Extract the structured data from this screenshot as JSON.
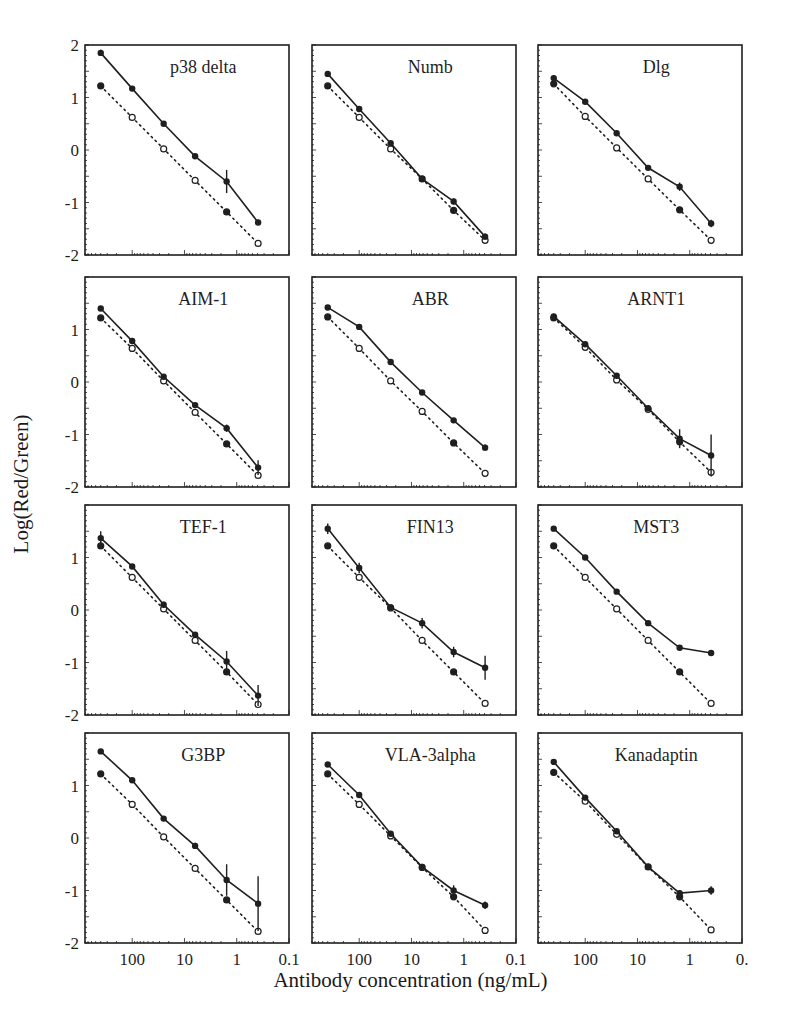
{
  "chart_data": {
    "type": "line",
    "layout": "4x3 grid of small multiples",
    "xlabel": "Antibody concentration (ng/mL)",
    "ylabel": "Log(Red/Green)",
    "xscale": "log",
    "xlim": [
      800,
      0.1
    ],
    "ylim": [
      -2,
      2
    ],
    "x_tick_labels": [
      "100",
      "10",
      "1",
      "0.1"
    ],
    "x_tick_labels_last_panel": [
      "100",
      "10",
      "1",
      "0."
    ],
    "y_tick_labels": [
      "2",
      "1",
      "0",
      "-1",
      "-2"
    ],
    "x": [
      400,
      100,
      25,
      6.25,
      1.56,
      0.39
    ],
    "series_styles": {
      "measured": "solid line, filled circles, error bars",
      "reference": "dotted line, open/filled markers"
    },
    "panels": [
      {
        "title": "p38 delta",
        "measured": [
          1.85,
          1.17,
          0.5,
          -0.12,
          -0.6,
          -1.38
        ],
        "errors": [
          0.06,
          0.04,
          0.03,
          0.04,
          0.22,
          0.05
        ],
        "reference": [
          1.22,
          0.62,
          0.02,
          -0.58,
          -1.18,
          -1.78
        ]
      },
      {
        "title": "Numb",
        "measured": [
          1.45,
          0.78,
          0.13,
          -0.55,
          -0.98,
          -1.65
        ],
        "errors": [
          0.05,
          0.03,
          0.04,
          0.03,
          0.06,
          0.06
        ],
        "reference": [
          1.22,
          0.62,
          0.02,
          -0.55,
          -1.15,
          -1.72
        ]
      },
      {
        "title": "Dlg",
        "measured": [
          1.37,
          0.92,
          0.32,
          -0.34,
          -0.7,
          -1.4
        ],
        "errors": [
          0.05,
          0.03,
          0.03,
          0.03,
          0.08,
          0.07
        ],
        "reference": [
          1.26,
          0.64,
          0.04,
          -0.55,
          -1.14,
          -1.72
        ]
      },
      {
        "title": "AIM-1",
        "measured": [
          1.4,
          0.78,
          0.1,
          -0.44,
          -0.88,
          -1.63
        ],
        "errors": [
          0.03,
          0.03,
          0.04,
          0.03,
          0.07,
          0.14
        ],
        "reference": [
          1.22,
          0.64,
          0.02,
          -0.58,
          -1.18,
          -1.78
        ]
      },
      {
        "title": "ABR",
        "measured": [
          1.42,
          1.05,
          0.38,
          -0.2,
          -0.73,
          -1.25
        ],
        "errors": [
          0.03,
          0.05,
          0.03,
          0.03,
          0.03,
          0.06
        ],
        "reference": [
          1.24,
          0.64,
          0.02,
          -0.56,
          -1.16,
          -1.74
        ]
      },
      {
        "title": "ARNT1",
        "measured": [
          1.25,
          0.72,
          0.12,
          -0.5,
          -1.08,
          -1.4
        ],
        "errors": [
          0.05,
          0.05,
          0.05,
          0.05,
          0.18,
          0.4
        ],
        "reference": [
          1.22,
          0.66,
          0.04,
          -0.52,
          -1.14,
          -1.72
        ]
      },
      {
        "title": "TEF-1",
        "measured": [
          1.37,
          0.83,
          0.1,
          -0.47,
          -0.98,
          -1.63
        ],
        "errors": [
          0.13,
          0.03,
          0.06,
          0.05,
          0.2,
          0.2
        ],
        "reference": [
          1.22,
          0.62,
          0.02,
          -0.58,
          -1.18,
          -1.8
        ]
      },
      {
        "title": "FIN13",
        "measured": [
          1.55,
          0.8,
          0.05,
          -0.25,
          -0.8,
          -1.1
        ],
        "errors": [
          0.1,
          0.1,
          0.03,
          0.1,
          0.1,
          0.23
        ],
        "reference": [
          1.22,
          0.62,
          0.04,
          -0.58,
          -1.18,
          -1.78
        ]
      },
      {
        "title": "MST3",
        "measured": [
          1.55,
          1.0,
          0.35,
          -0.25,
          -0.72,
          -0.82
        ],
        "errors": [
          0.02,
          0.02,
          0.02,
          0.02,
          0.04,
          0.02
        ],
        "reference": [
          1.22,
          0.62,
          0.02,
          -0.58,
          -1.18,
          -1.78
        ]
      },
      {
        "title": "G3BP",
        "measured": [
          1.65,
          1.1,
          0.37,
          -0.15,
          -0.8,
          -1.25
        ],
        "errors": [
          0.02,
          0.03,
          0.02,
          0.06,
          0.3,
          0.52
        ],
        "reference": [
          1.22,
          0.64,
          0.02,
          -0.58,
          -1.18,
          -1.78
        ]
      },
      {
        "title": "VLA-3alpha",
        "measured": [
          1.4,
          0.82,
          0.08,
          -0.55,
          -1.0,
          -1.28
        ],
        "errors": [
          0.02,
          0.03,
          0.05,
          0.03,
          0.1,
          0.07
        ],
        "reference": [
          1.22,
          0.64,
          0.04,
          -0.56,
          -1.12,
          -1.76
        ]
      },
      {
        "title": "Kanadaptin",
        "measured": [
          1.45,
          0.77,
          0.13,
          -0.55,
          -1.05,
          -1.0
        ],
        "errors": [
          0.02,
          0.05,
          0.05,
          0.03,
          0.06,
          0.08
        ],
        "reference": [
          1.25,
          0.7,
          0.07,
          -0.55,
          -1.12,
          -1.75
        ]
      }
    ]
  }
}
